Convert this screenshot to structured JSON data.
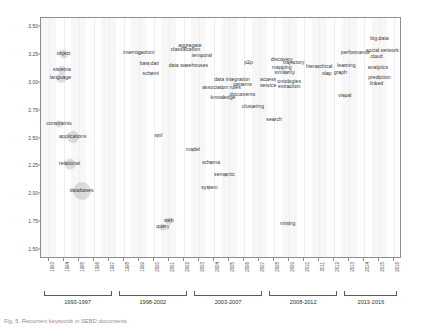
{
  "chart_data": {
    "type": "scatter",
    "title": "",
    "subtitle": "",
    "xlabel": "",
    "ylabel": "",
    "xlim": [
      1992.5,
      2016.5
    ],
    "ylim": [
      1.42,
      3.58
    ],
    "grid": true,
    "legend": null,
    "y_ticks": [
      "3.50",
      "3.25",
      "3.00",
      "2.75",
      "2.50",
      "2.25",
      "2.00",
      "1.75",
      "1.50"
    ],
    "y_tick_values": [
      3.5,
      3.25,
      3.0,
      2.75,
      2.5,
      2.25,
      2.0,
      1.75,
      1.5
    ],
    "x_ticks": [
      "1993",
      "1994",
      "1995",
      "1996",
      "1997",
      "1998",
      "1999",
      "2000",
      "2001",
      "2002",
      "2003",
      "2004",
      "2005",
      "2006",
      "2007",
      "2008",
      "2009",
      "2010",
      "2011",
      "2012",
      "2013",
      "2014",
      "2015",
      "2016"
    ],
    "periods": [
      {
        "label": "1993-1997",
        "start": 1993,
        "end": 1997
      },
      {
        "label": "1998-2002",
        "start": 1998,
        "end": 2002
      },
      {
        "label": "2003-2007",
        "start": 2003,
        "end": 2007
      },
      {
        "label": "2008-2012",
        "start": 2008,
        "end": 2012
      },
      {
        "label": "2013-2016",
        "start": 2013,
        "end": 2016
      }
    ],
    "bubble_color": "#969696",
    "label_color": "#3a3a3a",
    "points": [
      {
        "label": "object",
        "x": 1994.0,
        "y": 3.26,
        "size": 9
      },
      {
        "label": "sistema",
        "x": 1993.9,
        "y": 3.11,
        "size": 8
      },
      {
        "label": "language",
        "x": 1993.8,
        "y": 3.04,
        "size": 10
      },
      {
        "label": "interrogazioni",
        "x": 1999.0,
        "y": 3.27,
        "size": 4
      },
      {
        "label": "basi dati",
        "x": 1999.7,
        "y": 3.17,
        "size": 4
      },
      {
        "label": "schemi",
        "x": 1999.8,
        "y": 3.08,
        "size": 4
      },
      {
        "label": "aggregate",
        "x": 2002.4,
        "y": 3.33,
        "size": 3
      },
      {
        "label": "classification",
        "x": 2002.1,
        "y": 3.29,
        "size": 3
      },
      {
        "label": "temporal",
        "x": 2003.2,
        "y": 3.24,
        "size": 3
      },
      {
        "label": "data warehouses",
        "x": 2002.3,
        "y": 3.15,
        "size": 3
      },
      {
        "label": "p2p",
        "x": 2006.3,
        "y": 3.18,
        "size": 3
      },
      {
        "label": "data integration",
        "x": 2005.2,
        "y": 3.02,
        "size": 3
      },
      {
        "label": "patterns",
        "x": 2005.9,
        "y": 2.98,
        "size": 3
      },
      {
        "label": "association rules",
        "x": 2004.5,
        "y": 2.95,
        "size": 3
      },
      {
        "label": "knowledge",
        "x": 2004.6,
        "y": 2.86,
        "size": 3
      },
      {
        "label": "documents",
        "x": 2005.9,
        "y": 2.89,
        "size": 3
      },
      {
        "label": "clustering",
        "x": 2006.6,
        "y": 2.78,
        "size": 3
      },
      {
        "label": "access",
        "x": 2007.6,
        "y": 3.02,
        "size": 3
      },
      {
        "label": "service",
        "x": 2007.6,
        "y": 2.97,
        "size": 3
      },
      {
        "label": "discovery",
        "x": 2008.5,
        "y": 3.2,
        "size": 3
      },
      {
        "label": "trajectory",
        "x": 2009.3,
        "y": 3.18,
        "size": 3
      },
      {
        "label": "mapping",
        "x": 2008.5,
        "y": 3.13,
        "size": 3
      },
      {
        "label": "similarity",
        "x": 2008.7,
        "y": 3.09,
        "size": 3
      },
      {
        "label": "ontologies",
        "x": 2009.0,
        "y": 3.01,
        "size": 3
      },
      {
        "label": "extraction",
        "x": 2009.0,
        "y": 2.96,
        "size": 3
      },
      {
        "label": "hierarchical",
        "x": 2011.0,
        "y": 3.14,
        "size": 3
      },
      {
        "label": "olap",
        "x": 2011.5,
        "y": 3.08,
        "size": 3
      },
      {
        "label": "graph",
        "x": 2012.4,
        "y": 3.09,
        "size": 3
      },
      {
        "label": "learning",
        "x": 2012.8,
        "y": 3.15,
        "size": 3
      },
      {
        "label": "performance",
        "x": 2013.4,
        "y": 3.27,
        "size": 3
      },
      {
        "label": "big data",
        "x": 2015.0,
        "y": 3.39,
        "size": 3
      },
      {
        "label": "social network",
        "x": 2015.2,
        "y": 3.28,
        "size": 3
      },
      {
        "label": "cloud",
        "x": 2014.8,
        "y": 3.23,
        "size": 3
      },
      {
        "label": "analytics",
        "x": 2014.9,
        "y": 3.13,
        "size": 3
      },
      {
        "label": "prediction",
        "x": 2015.0,
        "y": 3.04,
        "size": 3
      },
      {
        "label": "linked",
        "x": 2014.8,
        "y": 2.99,
        "size": 3
      },
      {
        "label": "visual",
        "x": 2012.7,
        "y": 2.88,
        "size": 4
      },
      {
        "label": "search",
        "x": 2008.0,
        "y": 2.67,
        "size": 3
      },
      {
        "label": "constraints",
        "x": 1993.7,
        "y": 2.63,
        "size": 7
      },
      {
        "label": "applications",
        "x": 1994.6,
        "y": 2.51,
        "size": 12
      },
      {
        "label": "xml",
        "x": 2000.3,
        "y": 2.52,
        "size": 4
      },
      {
        "label": "model",
        "x": 2002.6,
        "y": 2.4,
        "size": 4
      },
      {
        "label": "relational",
        "x": 1994.4,
        "y": 2.27,
        "size": 11
      },
      {
        "label": "schema",
        "x": 2003.8,
        "y": 2.28,
        "size": 4
      },
      {
        "label": "semantic",
        "x": 2004.7,
        "y": 2.17,
        "size": 4
      },
      {
        "label": "databases",
        "x": 1995.2,
        "y": 2.03,
        "size": 18
      },
      {
        "label": "system",
        "x": 2003.7,
        "y": 2.06,
        "size": 4
      },
      {
        "label": "web",
        "x": 2001.0,
        "y": 1.76,
        "size": 7
      },
      {
        "label": "query",
        "x": 2000.6,
        "y": 1.71,
        "size": 7
      },
      {
        "label": "mining",
        "x": 2008.9,
        "y": 1.73,
        "size": 4
      }
    ]
  },
  "caption": {
    "text": "Fig. 5. Recurrent keywords in SEBD documents"
  }
}
